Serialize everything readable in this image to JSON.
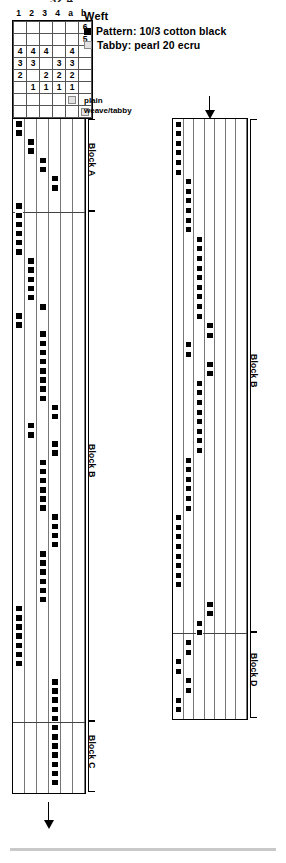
{
  "top_clipped_text": "32 4",
  "shaft_header": {
    "labels": [
      "1",
      "2",
      "3",
      "4",
      "a",
      "b"
    ]
  },
  "tieup": {
    "rows": [
      [
        "",
        "",
        "",
        "",
        "",
        "6"
      ],
      [
        "",
        "",
        "",
        "",
        "",
        "5"
      ],
      [
        "4",
        "4",
        "4",
        "",
        "4",
        ""
      ],
      [
        "3",
        "3",
        "",
        "3",
        "3",
        ""
      ],
      [
        "2",
        "",
        "2",
        "2",
        "2",
        ""
      ],
      [
        "",
        "1",
        "1",
        "1",
        "1",
        ""
      ],
      [
        "",
        "",
        "",
        "",
        "tabby",
        ""
      ],
      [
        "",
        "",
        "",
        "",
        "",
        "tabby"
      ]
    ]
  },
  "weft": {
    "title": "Weft",
    "items": [
      {
        "swatch": "pattern-swatch",
        "label": "Pattern:  10/3 cotton black"
      },
      {
        "swatch": "tabby-swatch",
        "label": "Tabby:  pearl 20 ecru"
      }
    ]
  },
  "callouts": {
    "plain": "plain",
    "tabby": "weave/tabby"
  },
  "left_draft": {
    "columns": 6,
    "blocks": [
      {
        "label": "Block A"
      },
      {
        "label": "Block B"
      },
      {
        "label": "Block C"
      }
    ]
  },
  "right_draft": {
    "columns": 7,
    "blocks": [
      {
        "label": "Block B"
      },
      {
        "label": "Block D"
      }
    ]
  },
  "chart_data": {
    "type": "table",
    "xlabel": "",
    "ylabel": "",
    "grid": true,
    "legend_position": "top-right",
    "colors": {
      "pattern": "#000000",
      "tabby": "#e2e2e2",
      "grid": "#777777",
      "border": "#000000"
    },
    "tieup_grid": {
      "col_headers": [
        "1",
        "2",
        "3",
        "4",
        "a",
        "b"
      ],
      "rows": [
        [
          "",
          "",
          "",
          "",
          "",
          "6"
        ],
        [
          "",
          "",
          "",
          "",
          "",
          "5"
        ],
        [
          "4",
          "4",
          "4",
          "",
          "4",
          ""
        ],
        [
          "3",
          "3",
          "",
          "3",
          "3",
          ""
        ],
        [
          "2",
          "",
          "2",
          "2",
          "2",
          ""
        ],
        [
          "",
          "1",
          "1",
          "1",
          "1",
          ""
        ],
        [
          "",
          "",
          "",
          "",
          "tabby",
          ""
        ],
        [
          "",
          "",
          "",
          "",
          "",
          "tabby"
        ]
      ]
    },
    "left_panel": {
      "num_columns": 6,
      "column_labels": [
        "1",
        "2",
        "3",
        "4",
        "a",
        "b"
      ],
      "block_separators_y": [
        211,
        721
      ],
      "blocks": [
        "Block A",
        "Block B",
        "Block C"
      ],
      "marks": [
        {
          "col": 0,
          "row": 0
        },
        {
          "col": 0,
          "row": 1
        },
        {
          "col": 1,
          "row": 2
        },
        {
          "col": 1,
          "row": 3
        },
        {
          "col": 2,
          "row": 4
        },
        {
          "col": 2,
          "row": 5
        },
        {
          "col": 3,
          "row": 6
        },
        {
          "col": 3,
          "row": 7
        },
        {
          "col": 0,
          "row": 9
        },
        {
          "col": 0,
          "row": 10
        },
        {
          "col": 0,
          "row": 11
        },
        {
          "col": 0,
          "row": 12
        },
        {
          "col": 0,
          "row": 13
        },
        {
          "col": 0,
          "row": 14
        },
        {
          "col": 1,
          "row": 15
        },
        {
          "col": 1,
          "row": 16
        },
        {
          "col": 1,
          "row": 17
        },
        {
          "col": 1,
          "row": 18
        },
        {
          "col": 1,
          "row": 19
        },
        {
          "col": 2,
          "row": 20
        },
        {
          "col": 0,
          "row": 21
        },
        {
          "col": 0,
          "row": 22
        },
        {
          "col": 2,
          "row": 23
        },
        {
          "col": 2,
          "row": 24
        },
        {
          "col": 2,
          "row": 25
        },
        {
          "col": 2,
          "row": 26
        },
        {
          "col": 2,
          "row": 27
        },
        {
          "col": 2,
          "row": 28
        },
        {
          "col": 2,
          "row": 29
        },
        {
          "col": 2,
          "row": 30
        },
        {
          "col": 3,
          "row": 31
        },
        {
          "col": 3,
          "row": 32
        },
        {
          "col": 1,
          "row": 33
        },
        {
          "col": 1,
          "row": 34
        },
        {
          "col": 3,
          "row": 35
        },
        {
          "col": 3,
          "row": 36
        },
        {
          "col": 2,
          "row": 37
        },
        {
          "col": 2,
          "row": 38
        },
        {
          "col": 2,
          "row": 39
        },
        {
          "col": 2,
          "row": 40
        },
        {
          "col": 2,
          "row": 41
        },
        {
          "col": 2,
          "row": 42
        },
        {
          "col": 3,
          "row": 43
        },
        {
          "col": 3,
          "row": 44
        },
        {
          "col": 3,
          "row": 45
        },
        {
          "col": 3,
          "row": 46
        },
        {
          "col": 2,
          "row": 47
        },
        {
          "col": 2,
          "row": 48
        },
        {
          "col": 2,
          "row": 49
        },
        {
          "col": 2,
          "row": 50
        },
        {
          "col": 2,
          "row": 51
        },
        {
          "col": 2,
          "row": 52
        },
        {
          "col": 0,
          "row": 53
        },
        {
          "col": 0,
          "row": 54
        },
        {
          "col": 0,
          "row": 55
        },
        {
          "col": 0,
          "row": 56
        },
        {
          "col": 0,
          "row": 57
        },
        {
          "col": 0,
          "row": 58
        },
        {
          "col": 0,
          "row": 59
        },
        {
          "col": 3,
          "row": 61
        },
        {
          "col": 3,
          "row": 62
        },
        {
          "col": 3,
          "row": 63
        },
        {
          "col": 3,
          "row": 64
        },
        {
          "col": 3,
          "row": 65
        },
        {
          "col": 3,
          "row": 66
        },
        {
          "col": 3,
          "row": 67
        },
        {
          "col": 3,
          "row": 68
        },
        {
          "col": 3,
          "row": 69
        },
        {
          "col": 3,
          "row": 70
        },
        {
          "col": 3,
          "row": 71
        },
        {
          "col": 3,
          "row": 72
        }
      ]
    },
    "right_panel": {
      "num_columns": 7,
      "block_separators_y": [
        632
      ],
      "blocks": [
        "Block B",
        "Block D"
      ],
      "marks": [
        {
          "col": 0,
          "row": 0
        },
        {
          "col": 0,
          "row": 1
        },
        {
          "col": 0,
          "row": 2
        },
        {
          "col": 0,
          "row": 3
        },
        {
          "col": 0,
          "row": 4
        },
        {
          "col": 0,
          "row": 5
        },
        {
          "col": 1,
          "row": 6
        },
        {
          "col": 1,
          "row": 7
        },
        {
          "col": 1,
          "row": 8
        },
        {
          "col": 1,
          "row": 9
        },
        {
          "col": 1,
          "row": 10
        },
        {
          "col": 1,
          "row": 11
        },
        {
          "col": 2,
          "row": 12
        },
        {
          "col": 2,
          "row": 13
        },
        {
          "col": 2,
          "row": 14
        },
        {
          "col": 2,
          "row": 15
        },
        {
          "col": 2,
          "row": 16
        },
        {
          "col": 2,
          "row": 17
        },
        {
          "col": 2,
          "row": 18
        },
        {
          "col": 2,
          "row": 19
        },
        {
          "col": 2,
          "row": 20
        },
        {
          "col": 3,
          "row": 21
        },
        {
          "col": 3,
          "row": 22
        },
        {
          "col": 1,
          "row": 23
        },
        {
          "col": 1,
          "row": 24
        },
        {
          "col": 3,
          "row": 25
        },
        {
          "col": 3,
          "row": 26
        },
        {
          "col": 2,
          "row": 27
        },
        {
          "col": 2,
          "row": 28
        },
        {
          "col": 2,
          "row": 29
        },
        {
          "col": 2,
          "row": 30
        },
        {
          "col": 2,
          "row": 31
        },
        {
          "col": 2,
          "row": 32
        },
        {
          "col": 2,
          "row": 33
        },
        {
          "col": 2,
          "row": 34
        },
        {
          "col": 1,
          "row": 35
        },
        {
          "col": 1,
          "row": 36
        },
        {
          "col": 1,
          "row": 37
        },
        {
          "col": 1,
          "row": 38
        },
        {
          "col": 1,
          "row": 39
        },
        {
          "col": 1,
          "row": 40
        },
        {
          "col": 0,
          "row": 41
        },
        {
          "col": 0,
          "row": 42
        },
        {
          "col": 0,
          "row": 43
        },
        {
          "col": 0,
          "row": 44
        },
        {
          "col": 0,
          "row": 45
        },
        {
          "col": 0,
          "row": 46
        },
        {
          "col": 0,
          "row": 47
        },
        {
          "col": 0,
          "row": 48
        },
        {
          "col": 3,
          "row": 50
        },
        {
          "col": 3,
          "row": 51
        },
        {
          "col": 2,
          "row": 52
        },
        {
          "col": 2,
          "row": 53
        },
        {
          "col": 1,
          "row": 54
        },
        {
          "col": 1,
          "row": 55
        },
        {
          "col": 0,
          "row": 56
        },
        {
          "col": 0,
          "row": 57
        },
        {
          "col": 1,
          "row": 58
        },
        {
          "col": 1,
          "row": 59
        },
        {
          "col": 0,
          "row": 60
        },
        {
          "col": 0,
          "row": 61
        }
      ]
    }
  }
}
